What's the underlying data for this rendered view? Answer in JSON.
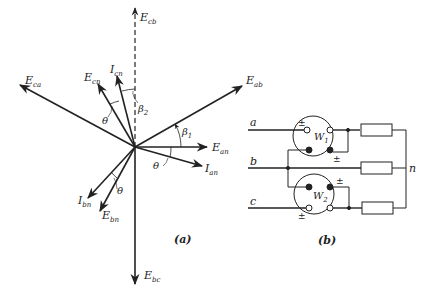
{
  "figure_a": {
    "caption": "(a)",
    "origin": [
      135,
      147
    ],
    "phasors": [
      {
        "id": "E_cb",
        "label": "E",
        "sub": "cb",
        "end": [
          135,
          8
        ],
        "style": "dashed"
      },
      {
        "id": "E_ab",
        "label": "E",
        "sub": "ab",
        "end": [
          242,
          86
        ],
        "style": "solid"
      },
      {
        "id": "E_an",
        "label": "E",
        "sub": "an",
        "end": [
          207,
          147
        ],
        "style": "solid"
      },
      {
        "id": "I_an",
        "label": "I",
        "sub": "an",
        "end": [
          202,
          166
        ],
        "style": "solid"
      },
      {
        "id": "E_ca",
        "label": "E",
        "sub": "ca",
        "end": [
          20,
          85
        ],
        "style": "solid"
      },
      {
        "id": "E_cn",
        "label": "E",
        "sub": "cn",
        "end": [
          98,
          84
        ],
        "style": "solid"
      },
      {
        "id": "I_cn",
        "label": "I",
        "sub": "cn",
        "end": [
          117,
          76
        ],
        "style": "solid"
      },
      {
        "id": "I_bn",
        "label": "I",
        "sub": "bn",
        "end": [
          88,
          198
        ],
        "style": "solid"
      },
      {
        "id": "E_bn",
        "label": "E",
        "sub": "bn",
        "end": [
          100,
          211
        ],
        "style": "solid"
      },
      {
        "id": "E_bc",
        "label": "E",
        "sub": "bc",
        "end": [
          135,
          284
        ],
        "style": "solid"
      }
    ],
    "angles": [
      {
        "symbol": "β",
        "sub": "1"
      },
      {
        "symbol": "β",
        "sub": "2"
      },
      {
        "symbol": "θ",
        "sub": ""
      },
      {
        "symbol": "θ",
        "sub": ""
      },
      {
        "symbol": "θ",
        "sub": ""
      }
    ]
  },
  "figure_b": {
    "caption": "(b)",
    "lines": [
      "a",
      "b",
      "c"
    ],
    "neutral": "n",
    "wattmeters": [
      {
        "label": "W",
        "sub": "1"
      },
      {
        "label": "W",
        "sub": "2"
      }
    ],
    "polarity_mark": "±"
  }
}
